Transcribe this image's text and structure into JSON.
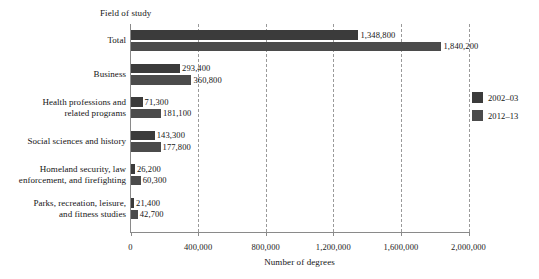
{
  "chart_data": {
    "type": "bar",
    "orientation": "horizontal",
    "title": "",
    "category_axis_title": "Field of study",
    "xlabel": "Number of degrees",
    "ylabel": "",
    "xlim": [
      0,
      2000000
    ],
    "xticks": [
      0,
      400000,
      800000,
      1200000,
      1600000,
      2000000
    ],
    "xtick_labels": [
      "0",
      "400,000",
      "800,000",
      "1,200,000",
      "1,600,000",
      "2,000,000"
    ],
    "grid": "vertical-dashed",
    "legend_position": "right",
    "categories": [
      "Total",
      "Business",
      "Health professions and related programs",
      "Social sciences and history",
      "Homeland security, law enforcement, and firefighting",
      "Parks, recreation, leisure, and fitness studies"
    ],
    "category_label_lines": [
      [
        "Total"
      ],
      [
        "Business"
      ],
      [
        "Health professions and",
        "related programs"
      ],
      [
        "Social sciences and history"
      ],
      [
        "Homeland security, law",
        "enforcement, and firefighting"
      ],
      [
        "Parks, recreation, leisure,",
        "and fitness studies"
      ]
    ],
    "series": [
      {
        "name": "2002–03",
        "color": "#3b3b3b",
        "values": [
          1348800,
          293400,
          71300,
          143300,
          26200,
          21400
        ],
        "value_labels": [
          "1,348,800",
          "293,400",
          "71,300",
          "143,300",
          "26,200",
          "21,400"
        ]
      },
      {
        "name": "2012–13",
        "color": "#4b4b4b",
        "values": [
          1840200,
          360800,
          181100,
          177800,
          60300,
          42700
        ],
        "value_labels": [
          "1,840,200",
          "360,800",
          "181,100",
          "177,800",
          "60,300",
          "42,700"
        ]
      }
    ]
  },
  "legend": {
    "items": [
      {
        "label": "2002–03",
        "color": "#3b3b3b"
      },
      {
        "label": "2012–13",
        "color": "#4b4b4b"
      }
    ]
  },
  "axis": {
    "x_title": "Number of degrees",
    "field_of_study_label": "Field of study"
  }
}
